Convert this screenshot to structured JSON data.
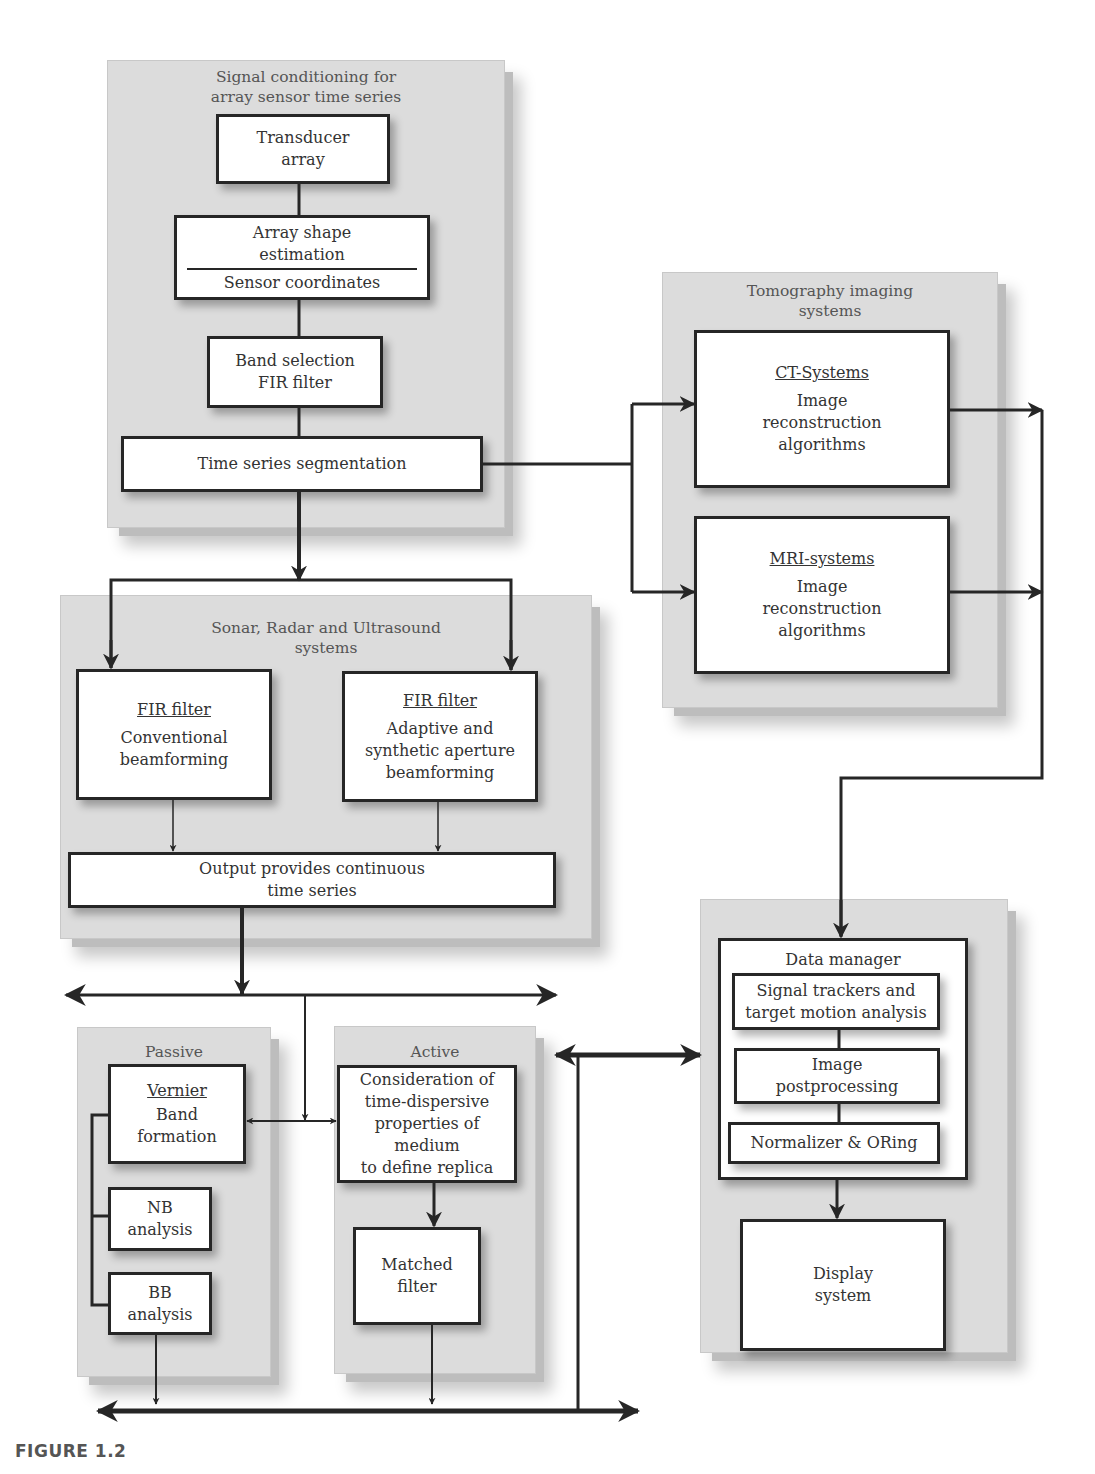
{
  "figure_caption": "FIGURE 1.2",
  "panels": {
    "signal_conditioning": {
      "title": "Signal conditioning for\narray sensor time series",
      "boxes": {
        "transducer": "Transducer\narray",
        "array_shape": "Array shape\nestimation",
        "sensor_coords": "Sensor coordinates",
        "band_selection": "Band selection\nFIR filter",
        "segmentation": "Time series segmentation"
      }
    },
    "tomography": {
      "title": "Tomography imaging\nsystems",
      "ct": {
        "heading": "CT-Systems",
        "body": "Image\nreconstruction\nalgorithms"
      },
      "mri": {
        "heading": "MRI-systems",
        "body": "Image\nreconstruction\nalgorithms"
      }
    },
    "sonar": {
      "title": "Sonar, Radar and Ultrasound\nsystems",
      "conventional": {
        "heading": "FIR filter",
        "body": "Conventional\nbeamforming"
      },
      "adaptive": {
        "heading": "FIR filter",
        "body": "Adaptive  and\nsynthetic aperture\nbeamforming"
      },
      "output": "Output provides continuous\ntime series"
    },
    "passive": {
      "title": "Passive",
      "vernier": {
        "heading": "Vernier",
        "body": "Band\nformation"
      },
      "nb": "NB\nanalysis",
      "bb": "BB\nanalysis"
    },
    "active": {
      "title": "Active",
      "consideration": "Consideration of\ntime-dispersive\nproperties of medium\nto define replica",
      "matched": "Matched\nfilter"
    },
    "data_manager": {
      "title": "Data manager",
      "trackers": "Signal trackers  and\ntarget motion analysis",
      "postprocessing": "Image\npostprocessing",
      "normalizer": "Normalizer & ORing",
      "display": "Display\nsystem"
    }
  }
}
